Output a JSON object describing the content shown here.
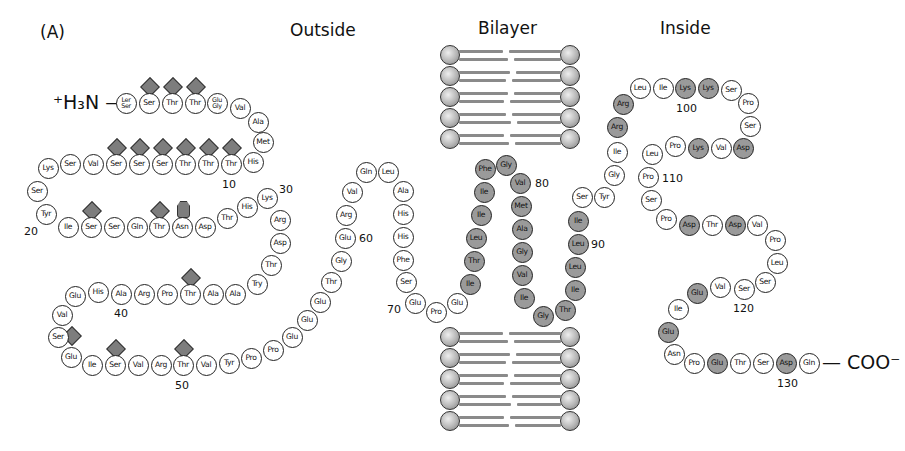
{
  "figure": {
    "panel_label": "(A)",
    "titles": {
      "outside": "Outside",
      "bilayer": "Bilayer",
      "inside": "Inside"
    },
    "n_terminus": "⁺H₃N —",
    "c_terminus": "— COO⁻",
    "legend_colors": {
      "unshaded_residue": "#ffffff",
      "transmembrane_or_charged_shaded": "#9a9a9a",
      "carbohydrate": "#7d7d7d"
    }
  },
  "residues": [
    {
      "t": "Ler/Ser",
      "x": 126,
      "y": 103,
      "s": 0
    },
    {
      "t": "Ser",
      "x": 149,
      "y": 103,
      "s": 0,
      "g": "d"
    },
    {
      "t": "Thr",
      "x": 172,
      "y": 103,
      "s": 0,
      "g": "d"
    },
    {
      "t": "Thr",
      "x": 195,
      "y": 103,
      "s": 0,
      "g": "d"
    },
    {
      "t": "Glu/Gly",
      "x": 217,
      "y": 103,
      "s": 0
    },
    {
      "t": "Val",
      "x": 240,
      "y": 108,
      "s": 0
    },
    {
      "t": "Ala",
      "x": 258,
      "y": 122,
      "s": 0
    },
    {
      "t": "Met",
      "x": 263,
      "y": 142,
      "s": 0
    },
    {
      "t": "His",
      "x": 253,
      "y": 162,
      "s": 0
    },
    {
      "t": "Thr",
      "x": 231,
      "y": 164,
      "s": 0,
      "g": "d"
    },
    {
      "t": "Thr",
      "x": 208,
      "y": 164,
      "s": 0,
      "g": "d"
    },
    {
      "t": "Thr",
      "x": 185,
      "y": 164,
      "s": 0,
      "g": "d"
    },
    {
      "t": "Ser",
      "x": 162,
      "y": 164,
      "s": 0,
      "g": "d"
    },
    {
      "t": "Ser",
      "x": 139,
      "y": 164,
      "s": 0,
      "g": "d"
    },
    {
      "t": "Ser",
      "x": 116,
      "y": 164,
      "s": 0,
      "g": "d"
    },
    {
      "t": "Val",
      "x": 93,
      "y": 164,
      "s": 0
    },
    {
      "t": "Ser",
      "x": 70,
      "y": 164,
      "s": 0
    },
    {
      "t": "Lys",
      "x": 48,
      "y": 168,
      "s": 0
    },
    {
      "t": "Ser",
      "x": 37,
      "y": 191,
      "s": 0
    },
    {
      "t": "Tyr",
      "x": 46,
      "y": 214,
      "s": 0
    },
    {
      "t": "Ile",
      "x": 68,
      "y": 227,
      "s": 0
    },
    {
      "t": "Ser",
      "x": 91,
      "y": 227,
      "s": 0,
      "g": "d"
    },
    {
      "t": "Ser",
      "x": 114,
      "y": 227,
      "s": 0
    },
    {
      "t": "Gln",
      "x": 137,
      "y": 227,
      "s": 0
    },
    {
      "t": "Thr",
      "x": 159,
      "y": 227,
      "s": 0,
      "g": "d"
    },
    {
      "t": "Asn",
      "x": 182,
      "y": 227,
      "s": 0,
      "g": "h"
    },
    {
      "t": "Asp",
      "x": 205,
      "y": 227,
      "s": 0
    },
    {
      "t": "Thr",
      "x": 227,
      "y": 218,
      "s": 0
    },
    {
      "t": "His",
      "x": 247,
      "y": 207,
      "s": 0
    },
    {
      "t": "Lys",
      "x": 267,
      "y": 198,
      "s": 0
    },
    {
      "t": "Arg",
      "x": 280,
      "y": 220,
      "s": 0
    },
    {
      "t": "Asp",
      "x": 280,
      "y": 243,
      "s": 0
    },
    {
      "t": "Thr",
      "x": 271,
      "y": 265,
      "s": 0
    },
    {
      "t": "Try",
      "x": 257,
      "y": 284,
      "s": 0
    },
    {
      "t": "Ala",
      "x": 235,
      "y": 294,
      "s": 0
    },
    {
      "t": "Ala",
      "x": 213,
      "y": 294,
      "s": 0
    },
    {
      "t": "Thr",
      "x": 190,
      "y": 294,
      "s": 0,
      "g": "d"
    },
    {
      "t": "Pro",
      "x": 167,
      "y": 294,
      "s": 0
    },
    {
      "t": "Arg",
      "x": 144,
      "y": 294,
      "s": 0
    },
    {
      "t": "Ala",
      "x": 121,
      "y": 294,
      "s": 0
    },
    {
      "t": "His",
      "x": 98,
      "y": 292,
      "s": 0
    },
    {
      "t": "Glu",
      "x": 75,
      "y": 296,
      "s": 0
    },
    {
      "t": "Val",
      "x": 62,
      "y": 315,
      "s": 0
    },
    {
      "t": "Ser",
      "x": 58,
      "y": 337,
      "s": 0,
      "g": "d2"
    },
    {
      "t": "Glu",
      "x": 71,
      "y": 357,
      "s": 0
    },
    {
      "t": "Ile",
      "x": 92,
      "y": 365,
      "s": 0
    },
    {
      "t": "Ser",
      "x": 115,
      "y": 365,
      "s": 0,
      "g": "d"
    },
    {
      "t": "Val",
      "x": 138,
      "y": 365,
      "s": 0
    },
    {
      "t": "Arg",
      "x": 161,
      "y": 365,
      "s": 0
    },
    {
      "t": "Thr",
      "x": 183,
      "y": 365,
      "s": 0,
      "g": "d"
    },
    {
      "t": "Val",
      "x": 206,
      "y": 365,
      "s": 0
    },
    {
      "t": "Tyr",
      "x": 229,
      "y": 363,
      "s": 0
    },
    {
      "t": "Pro",
      "x": 251,
      "y": 358,
      "s": 0
    },
    {
      "t": "Pro",
      "x": 273,
      "y": 350,
      "s": 0
    },
    {
      "t": "Glu",
      "x": 292,
      "y": 337,
      "s": 0
    },
    {
      "t": "Glu",
      "x": 307,
      "y": 320,
      "s": 0
    },
    {
      "t": "Glu",
      "x": 320,
      "y": 302,
      "s": 0
    },
    {
      "t": "Thr",
      "x": 331,
      "y": 282,
      "s": 0
    },
    {
      "t": "Gly",
      "x": 341,
      "y": 261,
      "s": 0
    },
    {
      "t": "Glu",
      "x": 345,
      "y": 238,
      "s": 0
    },
    {
      "t": "Arg",
      "x": 346,
      "y": 215,
      "s": 0
    },
    {
      "t": "Val",
      "x": 352,
      "y": 192,
      "s": 0
    },
    {
      "t": "Gln",
      "x": 366,
      "y": 172,
      "s": 0
    },
    {
      "t": "Leu",
      "x": 388,
      "y": 172,
      "s": 0
    },
    {
      "t": "Ala",
      "x": 403,
      "y": 191,
      "s": 0
    },
    {
      "t": "His",
      "x": 403,
      "y": 214,
      "s": 0
    },
    {
      "t": "His",
      "x": 403,
      "y": 237,
      "s": 0
    },
    {
      "t": "Phe",
      "x": 403,
      "y": 260,
      "s": 0
    },
    {
      "t": "Ser",
      "x": 406,
      "y": 282,
      "s": 0
    },
    {
      "t": "Glu",
      "x": 415,
      "y": 303,
      "s": 0
    },
    {
      "t": "Pro",
      "x": 436,
      "y": 312,
      "s": 0
    },
    {
      "t": "Glu",
      "x": 457,
      "y": 303,
      "s": 0
    },
    {
      "t": "Ile",
      "x": 470,
      "y": 284,
      "s": 1
    },
    {
      "t": "Thr",
      "x": 474,
      "y": 261,
      "s": 1
    },
    {
      "t": "Leu",
      "x": 476,
      "y": 238,
      "s": 1
    },
    {
      "t": "Ile",
      "x": 481,
      "y": 215,
      "s": 1
    },
    {
      "t": "Ile",
      "x": 484,
      "y": 192,
      "s": 1
    },
    {
      "t": "Phe",
      "x": 485,
      "y": 169,
      "s": 1
    },
    {
      "t": "Gly",
      "x": 506,
      "y": 165,
      "s": 1
    },
    {
      "t": "Val",
      "x": 520,
      "y": 183,
      "s": 1
    },
    {
      "t": "Met",
      "x": 521,
      "y": 206,
      "s": 1
    },
    {
      "t": "Ala",
      "x": 522,
      "y": 229,
      "s": 1
    },
    {
      "t": "Gly",
      "x": 522,
      "y": 252,
      "s": 1
    },
    {
      "t": "Val",
      "x": 522,
      "y": 275,
      "s": 1
    },
    {
      "t": "Ile",
      "x": 524,
      "y": 298,
      "s": 1
    },
    {
      "t": "Gly",
      "x": 543,
      "y": 316,
      "s": 1
    },
    {
      "t": "Thr",
      "x": 565,
      "y": 310,
      "s": 1
    },
    {
      "t": "Ile",
      "x": 575,
      "y": 290,
      "s": 1
    },
    {
      "t": "Leu",
      "x": 575,
      "y": 267,
      "s": 1
    },
    {
      "t": "Leu",
      "x": 578,
      "y": 244,
      "s": 1
    },
    {
      "t": "Ile",
      "x": 578,
      "y": 221,
      "s": 1
    },
    {
      "t": "Ser",
      "x": 582,
      "y": 197,
      "s": 0
    },
    {
      "t": "Tyr",
      "x": 604,
      "y": 197,
      "s": 0
    },
    {
      "t": "Gly",
      "x": 614,
      "y": 175,
      "s": 0
    },
    {
      "t": "Ile",
      "x": 617,
      "y": 152,
      "s": 0
    },
    {
      "t": "Arg",
      "x": 617,
      "y": 127,
      "s": 1
    },
    {
      "t": "Arg",
      "x": 623,
      "y": 104,
      "s": 1
    },
    {
      "t": "Leu",
      "x": 640,
      "y": 88,
      "s": 0
    },
    {
      "t": "Ile",
      "x": 663,
      "y": 88,
      "s": 0
    },
    {
      "t": "Lys",
      "x": 685,
      "y": 88,
      "s": 1
    },
    {
      "t": "Lys",
      "x": 708,
      "y": 88,
      "s": 1
    },
    {
      "t": "Ser",
      "x": 731,
      "y": 90,
      "s": 0
    },
    {
      "t": "Pro",
      "x": 748,
      "y": 103,
      "s": 0
    },
    {
      "t": "Ser",
      "x": 750,
      "y": 126,
      "s": 0
    },
    {
      "t": "Asp",
      "x": 743,
      "y": 148,
      "s": 1
    },
    {
      "t": "Val",
      "x": 721,
      "y": 148,
      "s": 0
    },
    {
      "t": "Lys",
      "x": 698,
      "y": 148,
      "s": 1
    },
    {
      "t": "Pro",
      "x": 675,
      "y": 146,
      "s": 0
    },
    {
      "t": "Leu",
      "x": 652,
      "y": 154,
      "s": 0
    },
    {
      "t": "Pro",
      "x": 648,
      "y": 177,
      "s": 0
    },
    {
      "t": "Ser",
      "x": 651,
      "y": 200,
      "s": 0
    },
    {
      "t": "Pro",
      "x": 666,
      "y": 219,
      "s": 0
    },
    {
      "t": "Asp",
      "x": 689,
      "y": 225,
      "s": 1
    },
    {
      "t": "Thr",
      "x": 712,
      "y": 225,
      "s": 0
    },
    {
      "t": "Asp",
      "x": 735,
      "y": 225,
      "s": 1
    },
    {
      "t": "Val",
      "x": 757,
      "y": 225,
      "s": 0
    },
    {
      "t": "Pro",
      "x": 775,
      "y": 240,
      "s": 0
    },
    {
      "t": "Leu",
      "x": 777,
      "y": 263,
      "s": 0
    },
    {
      "t": "Ser",
      "x": 765,
      "y": 282,
      "s": 0
    },
    {
      "t": "Ser",
      "x": 744,
      "y": 289,
      "s": 0
    },
    {
      "t": "Val",
      "x": 720,
      "y": 287,
      "s": 0
    },
    {
      "t": "Glu",
      "x": 697,
      "y": 293,
      "s": 1
    },
    {
      "t": "Ile",
      "x": 678,
      "y": 309,
      "s": 0
    },
    {
      "t": "Glu",
      "x": 668,
      "y": 332,
      "s": 1
    },
    {
      "t": "Asn",
      "x": 674,
      "y": 354,
      "s": 0
    },
    {
      "t": "Pro",
      "x": 694,
      "y": 363,
      "s": 0
    },
    {
      "t": "Glu",
      "x": 717,
      "y": 363,
      "s": 1
    },
    {
      "t": "Thr",
      "x": 740,
      "y": 363,
      "s": 0
    },
    {
      "t": "Ser",
      "x": 763,
      "y": 363,
      "s": 0
    },
    {
      "t": "Asp",
      "x": 786,
      "y": 363,
      "s": 1
    },
    {
      "t": "Gln",
      "x": 809,
      "y": 363,
      "s": 0
    }
  ],
  "numbers": [
    {
      "t": "10",
      "x": 222,
      "y": 178
    },
    {
      "t": "20",
      "x": 24,
      "y": 225
    },
    {
      "t": "30",
      "x": 279,
      "y": 183
    },
    {
      "t": "40",
      "x": 114,
      "y": 307
    },
    {
      "t": "50",
      "x": 175,
      "y": 379
    },
    {
      "t": "60",
      "x": 359,
      "y": 232
    },
    {
      "t": "70",
      "x": 387,
      "y": 303
    },
    {
      "t": "80",
      "x": 535,
      "y": 177
    },
    {
      "t": "90",
      "x": 591,
      "y": 238
    },
    {
      "t": "100",
      "x": 676,
      "y": 102
    },
    {
      "t": "110",
      "x": 662,
      "y": 172
    },
    {
      "t": "120",
      "x": 733,
      "y": 302
    },
    {
      "t": "130",
      "x": 777,
      "y": 377
    }
  ]
}
